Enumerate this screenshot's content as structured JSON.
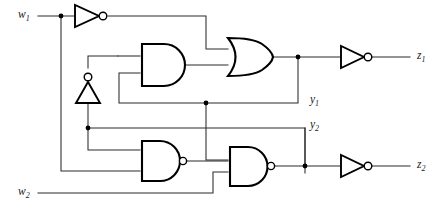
{
  "figure": {
    "kind": "logic-circuit-schematic",
    "background_color": "#ffffff",
    "wire_color": "#2b2b2b",
    "gate_outline_color": "#000000",
    "width": 443,
    "height": 218
  },
  "inputs": [
    {
      "id": "w1",
      "label": "w",
      "subscript": "1",
      "x": 18,
      "y": 16
    },
    {
      "id": "w2",
      "label": "w",
      "subscript": "2",
      "x": 18,
      "y": 186
    }
  ],
  "outputs": [
    {
      "id": "z1",
      "label": "z",
      "subscript": "1",
      "x": 417,
      "y": 47
    },
    {
      "id": "z2",
      "label": "z",
      "subscript": "2",
      "x": 417,
      "y": 164
    }
  ],
  "state_signals": [
    {
      "id": "y1",
      "label": "y",
      "subscript": "1",
      "x": 310,
      "y": 93
    },
    {
      "id": "y2",
      "label": "y",
      "subscript": "2",
      "x": 310,
      "y": 118
    }
  ],
  "gates": [
    {
      "id": "inv-w1",
      "type": "NOT",
      "orientation": "right",
      "inputs": 1,
      "has_bubble": true
    },
    {
      "id": "inv-up",
      "type": "NOT",
      "orientation": "up",
      "inputs": 1,
      "has_bubble": true
    },
    {
      "id": "and-1",
      "type": "AND",
      "orientation": "right",
      "inputs": 2,
      "has_bubble": false
    },
    {
      "id": "or-1",
      "type": "OR",
      "orientation": "right",
      "inputs": 2,
      "has_bubble": false
    },
    {
      "id": "inv-z1",
      "type": "NOT",
      "orientation": "right",
      "inputs": 1,
      "has_bubble": true
    },
    {
      "id": "nand-1",
      "type": "NAND",
      "orientation": "right",
      "inputs": 2,
      "has_bubble": true
    },
    {
      "id": "nand-2",
      "type": "NAND",
      "orientation": "right",
      "inputs": 3,
      "has_bubble": true
    },
    {
      "id": "inv-z2",
      "type": "NOT",
      "orientation": "right",
      "inputs": 1,
      "has_bubble": true
    }
  ]
}
